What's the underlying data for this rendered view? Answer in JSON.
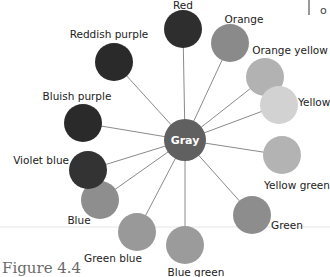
{
  "figure_caption": "Figure 4.4",
  "corner_text": "o",
  "center": {
    "label": "Gray",
    "x": 185,
    "y": 140,
    "r": 21,
    "color": "#606060"
  },
  "nodes": [
    {
      "label": "Red",
      "x": 183,
      "y": 29,
      "color": "#2e2e2e",
      "lx": 183,
      "ly": 9,
      "anchor": "middle"
    },
    {
      "label": "Orange",
      "x": 230,
      "y": 43,
      "color": "#8a8a8a",
      "lx": 244,
      "ly": 23,
      "anchor": "middle"
    },
    {
      "label": "Orange yellow",
      "x": 265,
      "y": 77,
      "color": "#b2b2b2",
      "lx": 290,
      "ly": 54,
      "anchor": "middle"
    },
    {
      "label": "Yellow",
      "x": 279,
      "y": 105,
      "color": "#d2d2d2",
      "lx": 298,
      "ly": 106,
      "anchor": "start"
    },
    {
      "label": "Yellow green",
      "x": 282,
      "y": 155,
      "color": "#b3b3b3",
      "lx": 297,
      "ly": 189,
      "anchor": "middle"
    },
    {
      "label": "Green",
      "x": 252,
      "y": 215,
      "color": "#8d8d8d",
      "lx": 271,
      "ly": 229,
      "anchor": "start"
    },
    {
      "label": "Blue green",
      "x": 185,
      "y": 245,
      "color": "#9b9b9b",
      "lx": 196,
      "ly": 276,
      "anchor": "middle"
    },
    {
      "label": "Green blue",
      "x": 137,
      "y": 232,
      "color": "#999999",
      "lx": 113,
      "ly": 262,
      "anchor": "middle"
    },
    {
      "label": "Blue",
      "x": 100,
      "y": 200,
      "color": "#8e8e8e",
      "lx": 79,
      "ly": 224,
      "anchor": "middle"
    },
    {
      "label": "Violet blue",
      "x": 88,
      "y": 170,
      "color": "#333333",
      "lx": 69,
      "ly": 164,
      "anchor": "end"
    },
    {
      "label": "Bluish purple",
      "x": 83,
      "y": 123,
      "color": "#2a2a2a",
      "lx": 77,
      "ly": 100,
      "anchor": "middle"
    },
    {
      "label": "Reddish purple",
      "x": 114,
      "y": 62,
      "color": "#2a2a2a",
      "lx": 109,
      "ly": 38,
      "anchor": "middle"
    }
  ],
  "node_radius": 19,
  "spoke_color": "#8a8a8a"
}
